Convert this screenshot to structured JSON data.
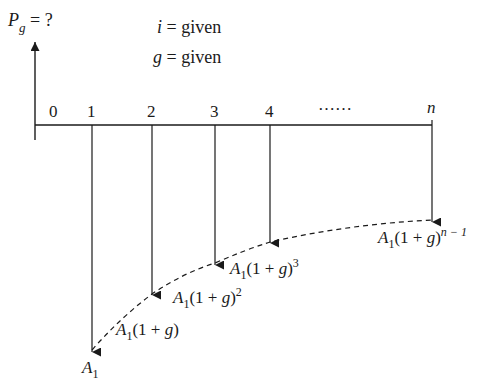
{
  "diagram": {
    "title_eq": {
      "symbol": "P",
      "subscript": "g",
      "rest": " = ?"
    },
    "given": [
      {
        "var": "i",
        "text": " = given"
      },
      {
        "var": "g",
        "text": " = given"
      }
    ],
    "axis": {
      "ticks": [
        "0",
        "1",
        "2",
        "3",
        "4",
        "n"
      ],
      "ellipsis": "……"
    },
    "cash_flows": [
      {
        "period": "1",
        "label_main": "A",
        "label_sub": "1",
        "label_tail": "",
        "label_sup": ""
      },
      {
        "period": "2",
        "label_main": "A",
        "label_sub": "1",
        "label_tail": "(1 + g)",
        "label_sup": ""
      },
      {
        "period": "3",
        "label_main": "A",
        "label_sub": "1",
        "label_tail": "(1 + g)",
        "label_sup": "2"
      },
      {
        "period": "4",
        "label_main": "A",
        "label_sub": "1",
        "label_tail": "(1 + g)",
        "label_sup": "3"
      },
      {
        "period": "n",
        "label_main": "A",
        "label_sub": "1",
        "label_tail": "(1 + g)",
        "label_sup": "n − 1"
      }
    ],
    "colors": {
      "line": "#1a1a1a",
      "background": "#ffffff"
    }
  }
}
